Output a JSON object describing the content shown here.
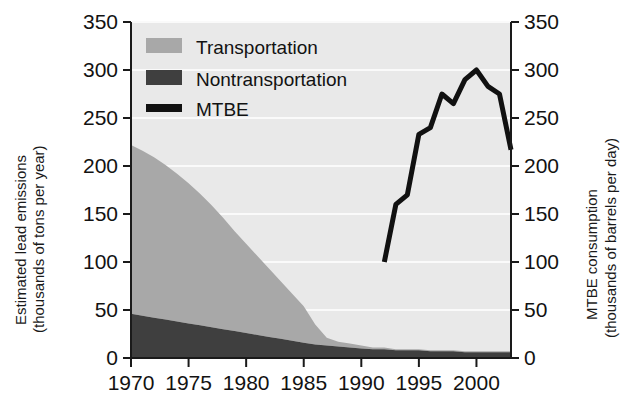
{
  "chart_data": {
    "type": "area",
    "title": "",
    "xlabel": "",
    "ylabel": "Estimated lead emissions\n(thousands of tons per year)",
    "y2label": "MTBE consumption\n(thousands of barrels per day)",
    "xlim": [
      1970,
      2003
    ],
    "ylim": [
      0,
      350
    ],
    "y2lim": [
      0,
      350
    ],
    "grid": true,
    "grid_orientation": "horizontal",
    "legend_position": "top-left",
    "x_ticks": [
      1970,
      1975,
      1980,
      1985,
      1990,
      1995,
      2000
    ],
    "x_tick_labels": [
      "1970",
      "1975",
      "1980",
      "1985",
      "1990",
      "1995",
      "2000"
    ],
    "y_ticks": [
      0,
      50,
      100,
      150,
      200,
      250,
      300,
      350
    ],
    "y_tick_labels": [
      "0",
      "50",
      "100",
      "150",
      "200",
      "250",
      "300",
      "350"
    ],
    "y2_ticks": [
      0,
      50,
      100,
      150,
      200,
      250,
      300,
      350
    ],
    "y2_tick_labels": [
      "0",
      "50",
      "100",
      "150",
      "200",
      "250",
      "300",
      "350"
    ],
    "series": [
      {
        "name": "Nontransportation",
        "type": "stacked-area",
        "color": "#3f3f3f",
        "axis": "left",
        "x": [
          1970,
          1971,
          1972,
          1973,
          1974,
          1975,
          1976,
          1977,
          1978,
          1979,
          1980,
          1981,
          1982,
          1983,
          1984,
          1985,
          1986,
          1987,
          1988,
          1989,
          1990,
          1991,
          1992,
          1993,
          1994,
          1995,
          1996,
          1997,
          1998,
          1999,
          2000,
          2001,
          2002,
          2003
        ],
        "values": [
          46,
          44,
          42,
          40,
          38,
          36,
          34,
          32,
          30,
          28,
          26,
          24,
          22,
          20,
          18,
          16,
          14,
          13,
          12,
          11,
          10,
          9,
          9,
          8,
          8,
          8,
          7,
          7,
          7,
          6,
          6,
          6,
          6,
          6
        ]
      },
      {
        "name": "Transportation",
        "type": "stacked-area",
        "color": "#a8a8a8",
        "axis": "left",
        "x": [
          1970,
          1971,
          1972,
          1973,
          1974,
          1975,
          1976,
          1977,
          1978,
          1979,
          1980,
          1981,
          1982,
          1983,
          1984,
          1985,
          1986,
          1987,
          1988,
          1989,
          1990,
          1991,
          1992,
          1993,
          1994,
          1995,
          1996,
          1997,
          1998,
          1999,
          2000,
          2001,
          2002,
          2003
        ],
        "values": [
          176,
          172,
          167,
          161,
          154,
          146,
          137,
          127,
          116,
          104,
          93,
          82,
          71,
          60,
          49,
          38,
          21,
          8,
          5,
          4,
          3,
          2,
          2,
          1,
          1,
          1,
          1,
          1,
          1,
          1,
          1,
          1,
          1,
          1
        ]
      },
      {
        "name": "Total lead emissions (stack top)",
        "type": "reference",
        "axis": "left",
        "x": [
          1970,
          1975,
          1980,
          1985,
          1990,
          1995,
          2000,
          2003
        ],
        "values": [
          222,
          182,
          119,
          54,
          13,
          9,
          7,
          7
        ]
      },
      {
        "name": "MTBE",
        "type": "line",
        "color": "#111111",
        "axis": "right",
        "x": [
          1992,
          1993,
          1994,
          1995,
          1996,
          1997,
          1998,
          1999,
          2000,
          2001,
          2002,
          2003
        ],
        "values": [
          100,
          160,
          170,
          233,
          240,
          275,
          265,
          290,
          300,
          283,
          275,
          217
        ]
      }
    ],
    "legend": [
      {
        "label": "Transportation",
        "swatch": "#a8a8a8",
        "style": "area"
      },
      {
        "label": "Nontransportation",
        "swatch": "#3f3f3f",
        "style": "area"
      },
      {
        "label": "MTBE",
        "swatch": "#111111",
        "style": "line"
      }
    ]
  },
  "axes": {
    "left_label_line1": "Estimated lead emissions",
    "left_label_line2": "(thousands of tons per year)",
    "right_label_line1": "MTBE consumption",
    "right_label_line2": "(thousands of barrels per day)"
  },
  "colors": {
    "transportation": "#a8a8a8",
    "nontransportation": "#3f3f3f",
    "mtbe_line": "#111111",
    "plot_background": "#e9e9e9",
    "gridline": "#fafafa",
    "axis": "#1a1a1a",
    "text": "#121212",
    "page_background": "#ffffff"
  }
}
